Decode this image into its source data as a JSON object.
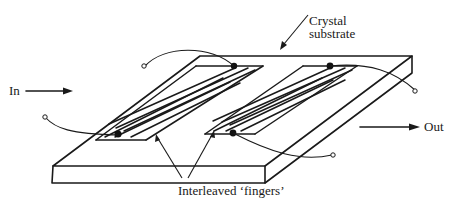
{
  "diagram": {
    "labels": {
      "input": "In",
      "output": "Out",
      "substrate_line1": "Crystal",
      "substrate_line2": "substrate",
      "fingers": "Interleaved ‘fingers’"
    },
    "components": [
      {
        "id": "substrate",
        "kind": "crystal slab"
      },
      {
        "id": "input-transducer",
        "kind": "interdigital electrode",
        "terminals": 2
      },
      {
        "id": "output-transducer",
        "kind": "interdigital electrode",
        "terminals": 2
      }
    ],
    "colors": {
      "ink": "#1a1a1a",
      "background": "#ffffff"
    }
  }
}
